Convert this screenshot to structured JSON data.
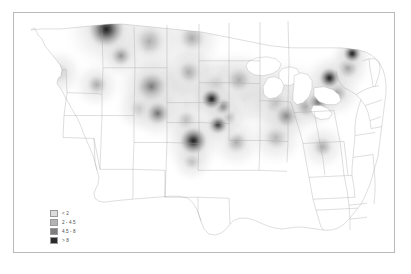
{
  "figure": {
    "background_color": "#ffffff",
    "frame_color": "#b9b9b9",
    "alt": "Grayscale kernel-density heat map of the contiguous United States"
  },
  "legend": {
    "name": "map-legend",
    "position": "lower-left",
    "items": [
      {
        "label": "< 2",
        "color": "#dcdcdc",
        "swatch_name": "legend-swatch-class-1"
      },
      {
        "label": "2 - 4.5",
        "color": "#b4b4b4",
        "swatch_name": "legend-swatch-class-2"
      },
      {
        "label": "4.5 - 8",
        "color": "#7d7d7d",
        "swatch_name": "legend-swatch-class-3"
      },
      {
        "label": "> 8",
        "color": "#2b2b2b",
        "swatch_name": "legend-swatch-class-4"
      }
    ]
  },
  "chart_data": {
    "type": "heatmap",
    "title": "",
    "subtitle": "",
    "xlabel": "",
    "ylabel": "",
    "grid": false,
    "legend_position": "lower-left",
    "projection": "contiguous-united-states",
    "value_unit": "density",
    "class_breaks": [
      0,
      2,
      4.5,
      8
    ],
    "class_labels": [
      "< 2",
      "2 - 4.5",
      "4.5 - 8",
      "> 8"
    ],
    "class_colors": [
      "#dcdcdc",
      "#b4b4b4",
      "#7d7d7d",
      "#2b2b2b"
    ],
    "background_value": 0,
    "hotspots": [
      {
        "name": "northern-montana",
        "x": 0.243,
        "y": 0.068,
        "radius": 0.052,
        "intensity": 9.5,
        "class": "> 8"
      },
      {
        "name": "western-montana",
        "x": 0.281,
        "y": 0.178,
        "radius": 0.03,
        "intensity": 5.2,
        "class": "4.5 - 8"
      },
      {
        "name": "central-north-dakota",
        "x": 0.355,
        "y": 0.118,
        "radius": 0.046,
        "intensity": 3.6,
        "class": "2 - 4.5"
      },
      {
        "name": "eastern-north-dakota",
        "x": 0.468,
        "y": 0.105,
        "radius": 0.04,
        "intensity": 3.2,
        "class": "2 - 4.5"
      },
      {
        "name": "south-dakota-east",
        "x": 0.46,
        "y": 0.248,
        "radius": 0.036,
        "intensity": 3.4,
        "class": "2 - 4.5"
      },
      {
        "name": "wyoming-east",
        "x": 0.362,
        "y": 0.31,
        "radius": 0.044,
        "intensity": 6.2,
        "class": "4.5 - 8"
      },
      {
        "name": "nebraska-west",
        "x": 0.378,
        "y": 0.42,
        "radius": 0.034,
        "intensity": 6.8,
        "class": "4.5 - 8"
      },
      {
        "name": "nebraska-central",
        "x": 0.452,
        "y": 0.448,
        "radius": 0.03,
        "intensity": 3.1,
        "class": "2 - 4.5"
      },
      {
        "name": "kansas-central",
        "x": 0.472,
        "y": 0.535,
        "radius": 0.04,
        "intensity": 9.8,
        "class": "> 8"
      },
      {
        "name": "iowa-northwest",
        "x": 0.52,
        "y": 0.36,
        "radius": 0.03,
        "intensity": 9.0,
        "class": "> 8"
      },
      {
        "name": "iowa-central",
        "x": 0.548,
        "y": 0.392,
        "radius": 0.026,
        "intensity": 8.4,
        "class": "> 8"
      },
      {
        "name": "iowa-southeast",
        "x": 0.562,
        "y": 0.435,
        "radius": 0.026,
        "intensity": 7.0,
        "class": "4.5 - 8"
      },
      {
        "name": "illinois-west",
        "x": 0.536,
        "y": 0.468,
        "radius": 0.028,
        "intensity": 8.6,
        "class": "> 8"
      },
      {
        "name": "minnesota-south",
        "x": 0.53,
        "y": 0.3,
        "radius": 0.038,
        "intensity": 3.0,
        "class": "2 - 4.5"
      },
      {
        "name": "wisconsin-central",
        "x": 0.592,
        "y": 0.28,
        "radius": 0.038,
        "intensity": 3.4,
        "class": "2 - 4.5"
      },
      {
        "name": "michigan-south",
        "x": 0.69,
        "y": 0.38,
        "radius": 0.036,
        "intensity": 4.2,
        "class": "2 - 4.5"
      },
      {
        "name": "indiana-ohio",
        "x": 0.718,
        "y": 0.43,
        "radius": 0.034,
        "intensity": 4.6,
        "class": "4.5 - 8"
      },
      {
        "name": "ohio-northeast",
        "x": 0.77,
        "y": 0.39,
        "radius": 0.032,
        "intensity": 5.0,
        "class": "4.5 - 8"
      },
      {
        "name": "pennsylvania-west",
        "x": 0.8,
        "y": 0.372,
        "radius": 0.03,
        "intensity": 6.0,
        "class": "4.5 - 8"
      },
      {
        "name": "new-york-upstate",
        "x": 0.83,
        "y": 0.272,
        "radius": 0.03,
        "intensity": 9.2,
        "class": "> 8"
      },
      {
        "name": "new-england-north",
        "x": 0.89,
        "y": 0.17,
        "radius": 0.026,
        "intensity": 8.8,
        "class": "> 8"
      },
      {
        "name": "new-england-coast",
        "x": 0.878,
        "y": 0.23,
        "radius": 0.03,
        "intensity": 6.4,
        "class": "4.5 - 8"
      },
      {
        "name": "mid-atlantic",
        "x": 0.848,
        "y": 0.332,
        "radius": 0.032,
        "intensity": 5.4,
        "class": "4.5 - 8"
      },
      {
        "name": "missouri-south",
        "x": 0.585,
        "y": 0.54,
        "radius": 0.034,
        "intensity": 2.6,
        "class": "2 - 4.5"
      },
      {
        "name": "kentucky-tennessee",
        "x": 0.69,
        "y": 0.52,
        "radius": 0.036,
        "intensity": 2.8,
        "class": "2 - 4.5"
      },
      {
        "name": "north-carolina",
        "x": 0.812,
        "y": 0.56,
        "radius": 0.03,
        "intensity": 2.4,
        "class": "2 - 4.5"
      },
      {
        "name": "oklahoma-north",
        "x": 0.468,
        "y": 0.62,
        "radius": 0.026,
        "intensity": 2.2,
        "class": "2 - 4.5"
      },
      {
        "name": "oregon-central",
        "x": 0.12,
        "y": 0.25,
        "radius": 0.03,
        "intensity": 1.6,
        "class": "< 2"
      },
      {
        "name": "idaho-south",
        "x": 0.218,
        "y": 0.3,
        "radius": 0.03,
        "intensity": 2.1,
        "class": "2 - 4.5"
      },
      {
        "name": "colorado-front-range",
        "x": 0.33,
        "y": 0.4,
        "radius": 0.03,
        "intensity": 2.3,
        "class": "2 - 4.5"
      }
    ]
  }
}
